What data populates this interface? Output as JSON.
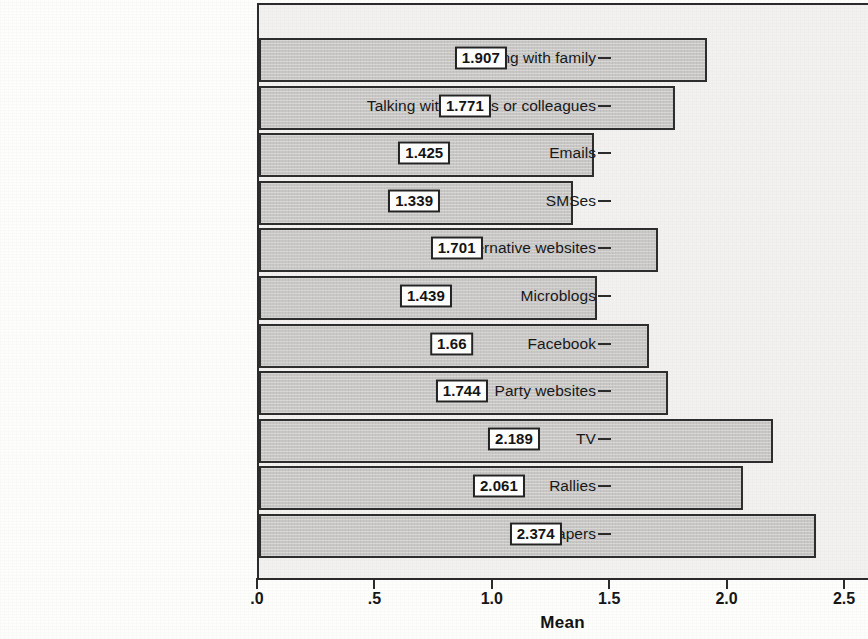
{
  "chart_data": {
    "type": "bar",
    "orientation": "horizontal",
    "title": "",
    "xlabel": "Mean",
    "ylabel": "",
    "xlim": [
      0,
      2.603
    ],
    "grid": false,
    "legend": null,
    "xticks": [
      {
        "value": 0,
        "label": ".0"
      },
      {
        "value": 0.5,
        "label": ".5"
      },
      {
        "value": 1.0,
        "label": "1.0"
      },
      {
        "value": 1.5,
        "label": "1.5"
      },
      {
        "value": 2.0,
        "label": "2.0"
      },
      {
        "value": 2.5,
        "label": "2.5"
      }
    ],
    "categories": [
      "Talking with family",
      "Talking with friends or colleagues",
      "Emails",
      "SMSes",
      "Alternative websites",
      "Microblogs",
      "Facebook",
      "Party websites",
      "TV",
      "Rallies",
      "Newspapers"
    ],
    "values": [
      1.907,
      1.771,
      1.425,
      1.339,
      1.701,
      1.439,
      1.66,
      1.744,
      2.189,
      2.061,
      2.374
    ],
    "value_labels": [
      "1.907",
      "1.771",
      "1.425",
      "1.339",
      "1.701",
      "1.439",
      "1.66",
      "1.744",
      "2.189",
      "2.061",
      "2.374"
    ]
  },
  "style": {
    "bar_fill": "#c9c8c6",
    "bar_border": "#2e2e2e",
    "plot_background": "#f2f1ef",
    "page_background": "#fdfdfc",
    "axis_color": "#2b2b2b",
    "text_color": "#18181a",
    "value_box_background": "#ffffff"
  }
}
